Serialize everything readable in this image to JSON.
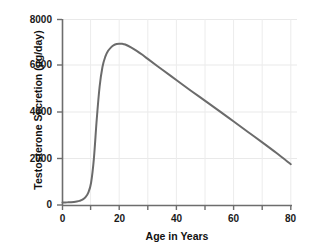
{
  "chart_data": {
    "type": "line",
    "title": "",
    "xlabel": "Age in Years",
    "ylabel": "Testosterone Secretion (µg/day)",
    "xlim": [
      0,
      80
    ],
    "ylim": [
      0,
      8000
    ],
    "xticks": [
      0,
      20,
      40,
      60,
      80
    ],
    "xtick_labels": [
      "0",
      "20",
      "40",
      "60",
      "80"
    ],
    "xminor_ticks": [
      10,
      30,
      50,
      70
    ],
    "yticks": [
      0,
      2000,
      4000,
      6000,
      8000
    ],
    "ytick_labels": [
      "0",
      "2000",
      "4000",
      "6000",
      "8000"
    ],
    "grid": true,
    "grid_color": "#e8e8e8",
    "legend": null,
    "line_color": "#6b6b6b",
    "line_width": 2,
    "series": [
      {
        "name": "Testosterone secretion",
        "x": [
          0,
          1,
          2,
          3,
          4,
          5,
          6,
          7,
          8,
          9,
          10,
          11,
          12,
          13,
          14,
          15,
          16,
          17,
          18,
          19,
          20,
          21,
          22,
          24,
          26,
          28,
          30,
          35,
          40,
          45,
          50,
          55,
          60,
          65,
          70,
          75,
          80
        ],
        "values": [
          110,
          110,
          115,
          120,
          130,
          150,
          180,
          230,
          330,
          520,
          950,
          2000,
          3700,
          5100,
          5950,
          6400,
          6650,
          6800,
          6900,
          6940,
          6950,
          6950,
          6920,
          6800,
          6650,
          6480,
          6290,
          5830,
          5380,
          4930,
          4490,
          4050,
          3600,
          3150,
          2700,
          2240,
          1760
        ]
      }
    ],
    "annotations": {
      "peak_age": 21,
      "peak_value": 6950,
      "onset_age": 9,
      "end_value": 1760
    }
  },
  "axes": {
    "y_title": "Testosterone Secretion (µg/day)",
    "x_title": "Age in Years",
    "y_labels": {
      "t0": "0",
      "t1": "2000",
      "t2": "4000",
      "t3": "6000",
      "t4": "8000"
    },
    "x_labels": {
      "t0": "0",
      "t1": "20",
      "t2": "40",
      "t3": "60",
      "t4": "80"
    }
  }
}
